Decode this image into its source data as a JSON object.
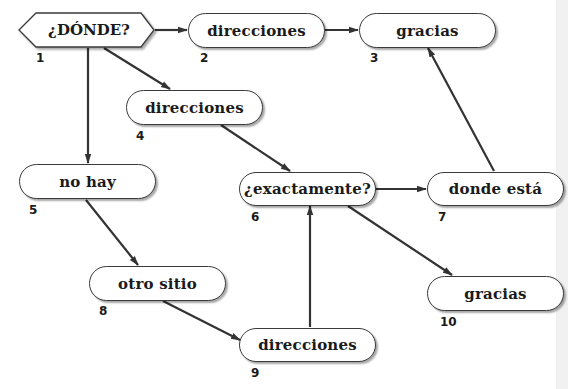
{
  "diagram": {
    "type": "flowchart",
    "nodes": [
      {
        "id": 1,
        "label": "¿DÓNDE?",
        "number": "1",
        "shape": "hexagon"
      },
      {
        "id": 2,
        "label": "direcciones",
        "number": "2",
        "shape": "rounded"
      },
      {
        "id": 3,
        "label": "gracias",
        "number": "3",
        "shape": "rounded"
      },
      {
        "id": 4,
        "label": "direcciones",
        "number": "4",
        "shape": "rounded"
      },
      {
        "id": 5,
        "label": "no hay",
        "number": "5",
        "shape": "rounded"
      },
      {
        "id": 6,
        "label": "¿exactamente?",
        "number": "6",
        "shape": "rounded"
      },
      {
        "id": 7,
        "label": "donde está",
        "number": "7",
        "shape": "rounded"
      },
      {
        "id": 8,
        "label": "otro sitio",
        "number": "8",
        "shape": "rounded"
      },
      {
        "id": 9,
        "label": "direcciones",
        "number": "9",
        "shape": "rounded"
      },
      {
        "id": 10,
        "label": "gracias",
        "number": "10",
        "shape": "rounded"
      }
    ],
    "edges": [
      {
        "from": 1,
        "to": 2
      },
      {
        "from": 2,
        "to": 3
      },
      {
        "from": 1,
        "to": 4
      },
      {
        "from": 1,
        "to": 5
      },
      {
        "from": 4,
        "to": 6
      },
      {
        "from": 6,
        "to": 7
      },
      {
        "from": 7,
        "to": 3
      },
      {
        "from": 5,
        "to": 8
      },
      {
        "from": 8,
        "to": 9
      },
      {
        "from": 9,
        "to": 6
      },
      {
        "from": 6,
        "to": 10
      }
    ],
    "colors": {
      "line": "#333333",
      "node_fill": "#ffffff",
      "node_border": "#3a3a3a"
    }
  }
}
